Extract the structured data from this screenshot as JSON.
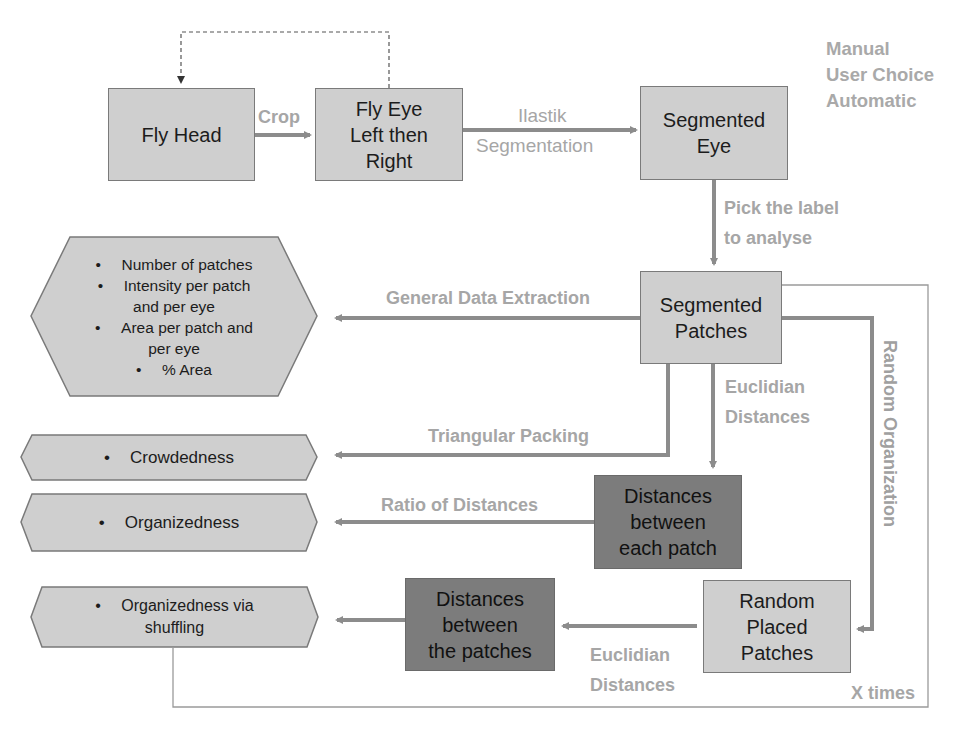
{
  "diagram": {
    "type": "flowchart",
    "colors": {
      "box_fill": "#cfcfcf",
      "dark_box_fill": "#7c7c7c",
      "arrow": "#8c8c8c",
      "label_text": "#a6a6a6",
      "loop_line": "#9a9a9a"
    },
    "legend": {
      "items": [
        "Manual",
        "User Choice",
        "Automatic"
      ]
    },
    "nodes": {
      "fly_head": {
        "lines": [
          "Fly Head"
        ]
      },
      "fly_eye": {
        "lines": [
          "Fly Eye",
          "Left then",
          "Right"
        ]
      },
      "segmented_eye": {
        "lines": [
          "Segmented",
          "Eye"
        ]
      },
      "segmented_patches": {
        "lines": [
          "Segmented",
          "Patches"
        ]
      },
      "distances_each_patch": {
        "lines": [
          "Distances",
          "between",
          "each patch"
        ]
      },
      "random_placed_patches": {
        "lines": [
          "Random",
          "Placed",
          "Patches"
        ]
      },
      "distances_the_patches": {
        "lines": [
          "Distances",
          "between",
          "the patches"
        ]
      }
    },
    "outputs": {
      "general": {
        "items": [
          [
            "Number of patches"
          ],
          [
            "Intensity per patch",
            "and per eye"
          ],
          [
            "Area per patch and",
            "per eye"
          ],
          [
            "% Area"
          ]
        ]
      },
      "crowdedness": {
        "items": [
          [
            "Crowdedness"
          ]
        ]
      },
      "organizedness": {
        "items": [
          [
            "Organizedness"
          ]
        ]
      },
      "organizedness_shuffling": {
        "items": [
          [
            "Organizedness via",
            "shuffling"
          ]
        ]
      }
    },
    "bullet": "•",
    "edge_labels": {
      "crop": "Crop",
      "ilastik_1": "Ilastik",
      "ilastik_2": "Segmentation",
      "pick_1": "Pick the label",
      "pick_2": "to analyse",
      "general_extraction": "General Data Extraction",
      "euclid_1": "Euclidian",
      "euclid_2": "Distances",
      "triangular": "Triangular Packing",
      "ratio": "Ratio of Distances",
      "random_org": "Random Organization",
      "euclid_b_1": "Euclidian",
      "euclid_b_2": "Distances",
      "x_times": "X times"
    }
  }
}
